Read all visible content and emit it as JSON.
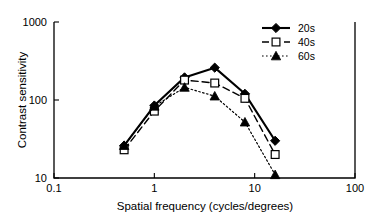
{
  "chart_data": {
    "type": "line",
    "title": "",
    "xlabel": "Spatial frequency (cycles/degrees)",
    "ylabel": "Contrast sensitivity",
    "xscale": "log",
    "yscale": "log",
    "xlim": [
      0.1,
      100
    ],
    "ylim": [
      10,
      1000
    ],
    "xticks": [
      "0.1",
      "1",
      "10",
      "100"
    ],
    "xtick_values": [
      0.1,
      1,
      10,
      100
    ],
    "yticks": [
      "1000",
      "100",
      "10"
    ],
    "ytick_values": [
      1000,
      100,
      10
    ],
    "grid": false,
    "legend_position": "top-right",
    "x": [
      0.5,
      1,
      2,
      4,
      8,
      16
    ],
    "series": [
      {
        "name": "20s",
        "marker": "filled-diamond",
        "linestyle": "solid",
        "color": "#000000",
        "values": [
          26,
          85,
          195,
          260,
          120,
          30
        ]
      },
      {
        "name": "40s",
        "marker": "open-square",
        "linestyle": "dashed",
        "color": "#000000",
        "values": [
          23,
          72,
          180,
          165,
          105,
          20
        ]
      },
      {
        "name": "60s",
        "marker": "filled-triangle",
        "linestyle": "dotted",
        "color": "#000000",
        "values": [
          26,
          83,
          145,
          112,
          52,
          11
        ]
      }
    ]
  },
  "legend": {
    "items": [
      {
        "label": "20s"
      },
      {
        "label": "40s"
      },
      {
        "label": "60s"
      }
    ]
  }
}
